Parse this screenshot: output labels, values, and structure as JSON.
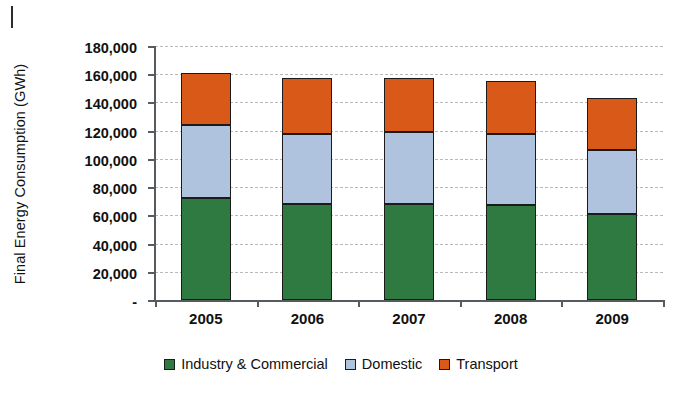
{
  "chart_data": {
    "type": "bar",
    "subtype": "stacked-column",
    "title": "",
    "xlabel": "",
    "ylabel": "Final Energy Consumption (GWh)",
    "categories": [
      "2005",
      "2006",
      "2007",
      "2008",
      "2009"
    ],
    "series": [
      {
        "name": "Industry & Commercial",
        "color": "#2F7A40",
        "values": [
          72000,
          68000,
          68000,
          67500,
          61000
        ]
      },
      {
        "name": "Domestic",
        "color": "#AFC3DE",
        "values": [
          52000,
          50000,
          51000,
          50500,
          45000
        ]
      },
      {
        "name": "Transport",
        "color": "#D95A18",
        "values": [
          37000,
          39000,
          38000,
          37000,
          37000
        ]
      }
    ],
    "totals": [
      161000,
      157000,
      157000,
      155000,
      143000
    ],
    "ylim": [
      0,
      180000
    ],
    "ytick_values": [
      0,
      20000,
      40000,
      60000,
      80000,
      100000,
      120000,
      140000,
      160000,
      180000
    ],
    "ytick_labels": [
      "-",
      "20,000",
      "40,000",
      "60,000",
      "80,000",
      "100,000",
      "120,000",
      "140,000",
      "160,000",
      "180,000"
    ],
    "grid": true,
    "grid_style": "dashed-horizontal",
    "legend_position": "bottom-center"
  },
  "legend": {
    "items": [
      {
        "label": "Industry & Commercial",
        "swatch": "legend-swatch-industry"
      },
      {
        "label": "Domestic",
        "swatch": "legend-swatch-domestic"
      },
      {
        "label": "Transport",
        "swatch": "legend-swatch-transport"
      }
    ]
  }
}
